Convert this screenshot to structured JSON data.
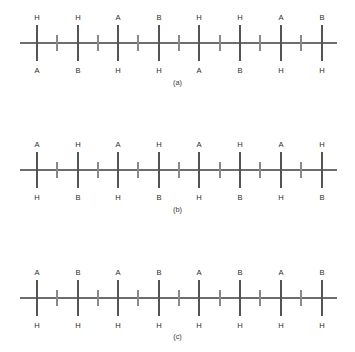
{
  "figure": {
    "name": "copolymer-chain-configurations",
    "background_color": "#ffffff",
    "line_color": "#6d6d6d",
    "tick_color": "#8a8a8a",
    "text_color": "#2e2e2e"
  },
  "panels": [
    {
      "id": "a",
      "caption": "(a)",
      "units": 8,
      "top_labels": [
        "H",
        "H",
        "A",
        "B",
        "H",
        "H",
        "A",
        "B"
      ],
      "bottom_labels": [
        "A",
        "B",
        "H",
        "H",
        "A",
        "B",
        "H",
        "H"
      ]
    },
    {
      "id": "b",
      "caption": "(b)",
      "units": 8,
      "top_labels": [
        "A",
        "H",
        "A",
        "H",
        "A",
        "H",
        "A",
        "H"
      ],
      "bottom_labels": [
        "H",
        "B",
        "H",
        "B",
        "H",
        "B",
        "H",
        "B"
      ]
    },
    {
      "id": "c",
      "caption": "(c)",
      "units": 8,
      "top_labels": [
        "A",
        "B",
        "A",
        "B",
        "A",
        "B",
        "A",
        "B"
      ],
      "bottom_labels": [
        "H",
        "H",
        "H",
        "H",
        "H",
        "H",
        "H",
        "H"
      ]
    }
  ],
  "geometry": {
    "panel_tops": [
      10,
      137,
      265
    ],
    "panel_height": 75,
    "backbone_y": 33,
    "backbone_x_start": 20,
    "backbone_x_end": 337,
    "carbon_x": [
      37,
      78,
      118,
      159,
      199,
      240,
      281,
      322
    ],
    "tick_x": [
      57,
      98,
      138,
      179,
      220,
      260,
      301
    ],
    "pendant_up_y": 15,
    "pendant_down_y": 51,
    "tick_half_height": 8,
    "top_label_y": 10,
    "bottom_label_y": 63,
    "caption_offsets": [
      78,
      205,
      332
    ]
  }
}
